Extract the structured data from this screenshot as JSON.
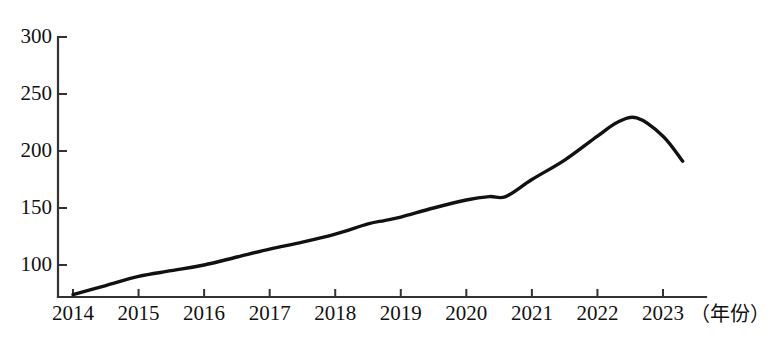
{
  "chart_data": {
    "type": "line",
    "title": "",
    "xlabel": "（年份）",
    "ylabel": "",
    "grid": false,
    "legend": "none",
    "xlim": [
      2014,
      2023.3
    ],
    "ylim": [
      73,
      300
    ],
    "yticks": [
      100,
      150,
      200,
      250,
      300
    ],
    "ytick_labels": [
      "100",
      "150",
      "200",
      "250",
      "300"
    ],
    "xticks": [
      2014,
      2015,
      2016,
      2017,
      2018,
      2019,
      2020,
      2021,
      2022,
      2023
    ],
    "xtick_labels": [
      "2014",
      "2015",
      "2016",
      "2017",
      "2018",
      "2019",
      "2020",
      "2021",
      "2022",
      "2023"
    ],
    "line_color": "#111111",
    "axis_color": "#333333",
    "series": [
      {
        "name": "数值",
        "x": [
          2014,
          2014.5,
          2015,
          2015.5,
          2016,
          2016.5,
          2017,
          2017.5,
          2018,
          2018.5,
          2018.75,
          2019,
          2019.5,
          2020,
          2020.35,
          2020.6,
          2021,
          2021.5,
          2022,
          2022.3,
          2022.6,
          2023,
          2023.3
        ],
        "values": [
          74,
          82,
          90,
          95,
          100,
          107,
          114,
          120,
          127,
          136,
          139,
          142,
          150,
          157,
          160,
          160,
          175,
          192,
          213,
          225,
          229,
          213,
          191
        ]
      }
    ],
    "annotations": []
  },
  "axis": {
    "x_caption": "（年份）"
  }
}
